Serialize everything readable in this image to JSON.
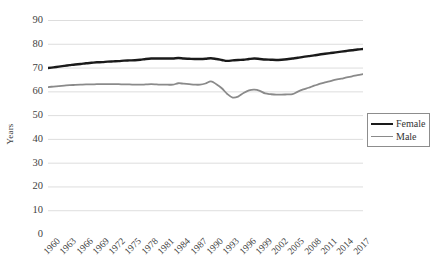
{
  "chart_data": {
    "type": "line",
    "title": "",
    "xlabel": "",
    "ylabel": "Years",
    "ylim": [
      0,
      90
    ],
    "ytick_step": 10,
    "yticks": [
      90,
      80,
      70,
      60,
      50,
      40,
      30,
      20,
      10,
      0
    ],
    "grid": "horizontal",
    "legend_position": "right",
    "xtick_labels": [
      "1960",
      "1963",
      "1966",
      "1969",
      "1972",
      "1975",
      "1978",
      "1981",
      "1984",
      "1987",
      "1990",
      "1993",
      "1996",
      "1999",
      "2002",
      "2005",
      "2008",
      "2011",
      "2014",
      "2017"
    ],
    "x": [
      1960,
      1961,
      1962,
      1963,
      1964,
      1965,
      1966,
      1967,
      1968,
      1969,
      1970,
      1971,
      1972,
      1973,
      1974,
      1975,
      1976,
      1977,
      1978,
      1979,
      1980,
      1981,
      1982,
      1983,
      1984,
      1985,
      1986,
      1987,
      1988,
      1989,
      1990,
      1991,
      1992,
      1993,
      1994,
      1995,
      1996,
      1997,
      1998,
      1999,
      2000,
      2001,
      2002,
      2003,
      2004,
      2005,
      2006,
      2007,
      2008,
      2009,
      2010,
      2011,
      2012,
      2013,
      2014,
      2015,
      2016,
      2017,
      2018
    ],
    "series": [
      {
        "name": "Female",
        "color": "#1a1a1a",
        "values": [
          69.8,
          70.1,
          70.4,
          70.7,
          71.0,
          71.3,
          71.5,
          71.8,
          72.0,
          72.2,
          72.3,
          72.5,
          72.6,
          72.7,
          72.9,
          73.0,
          73.1,
          73.3,
          73.6,
          73.8,
          73.8,
          73.8,
          73.8,
          73.8,
          74.0,
          73.8,
          73.7,
          73.6,
          73.6,
          73.7,
          73.9,
          73.6,
          73.2,
          72.8,
          73.0,
          73.2,
          73.3,
          73.6,
          73.8,
          73.6,
          73.4,
          73.3,
          73.2,
          73.3,
          73.5,
          73.8,
          74.1,
          74.5,
          74.8,
          75.1,
          75.5,
          75.8,
          76.1,
          76.4,
          76.7,
          77.0,
          77.3,
          77.6,
          77.8
        ]
      },
      {
        "name": "Male",
        "color": "#8a8a8a",
        "values": [
          61.8,
          62.0,
          62.2,
          62.4,
          62.6,
          62.7,
          62.8,
          62.9,
          62.9,
          63.0,
          63.0,
          63.0,
          63.0,
          63.0,
          62.9,
          62.9,
          62.8,
          62.8,
          62.9,
          63.0,
          62.9,
          62.8,
          62.8,
          62.8,
          63.4,
          63.2,
          63.0,
          62.8,
          62.8,
          63.3,
          64.2,
          63.0,
          61.3,
          58.9,
          57.4,
          57.8,
          59.3,
          60.4,
          60.7,
          60.2,
          59.1,
          58.8,
          58.6,
          58.6,
          58.7,
          58.8,
          59.9,
          60.8,
          61.5,
          62.4,
          63.1,
          63.8,
          64.3,
          64.9,
          65.3,
          65.9,
          66.3,
          66.8,
          67.2
        ]
      }
    ]
  },
  "legend": {
    "items": [
      {
        "label": "Female",
        "color": "#1a1a1a",
        "width": 2.4
      },
      {
        "label": "Male",
        "color": "#8a8a8a",
        "width": 1.8
      }
    ]
  },
  "axis": {
    "y_title": "Years"
  }
}
